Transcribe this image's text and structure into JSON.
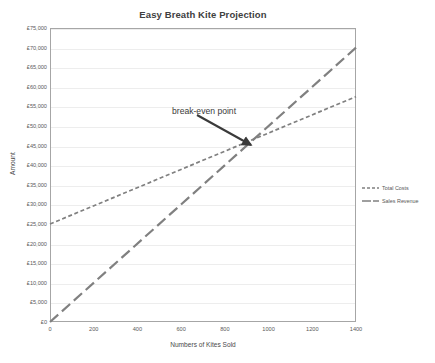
{
  "chart_data": {
    "type": "line",
    "title": "Easy Breath Kite Projection",
    "xlabel": "Numbers of Kites Sold",
    "ylabel": "Amount",
    "xlim": [
      0,
      1400
    ],
    "ylim": [
      0,
      75000
    ],
    "grid": true,
    "legend_position": "right",
    "x": [
      0,
      1400
    ],
    "xticks": [
      "0",
      "200",
      "400",
      "600",
      "800",
      "1000",
      "1200",
      "1400"
    ],
    "xtick_values": [
      0,
      200,
      400,
      600,
      800,
      1000,
      1200,
      1400
    ],
    "yticks": [
      "£0",
      "£5,000",
      "£10,000",
      "£15,000",
      "£20,000",
      "£25,000",
      "£30,000",
      "£35,000",
      "£40,000",
      "£45,000",
      "£50,000",
      "£55,000",
      "£60,000",
      "£65,000",
      "£70,000",
      "£75,000"
    ],
    "ytick_values": [
      0,
      5000,
      10000,
      15000,
      20000,
      25000,
      30000,
      35000,
      40000,
      45000,
      50000,
      55000,
      60000,
      65000,
      70000,
      75000
    ],
    "series": [
      {
        "name": "Total Costs",
        "style": "dashed",
        "color": "#808080",
        "x": [
          0,
          1400
        ],
        "values": [
          25000,
          57500
        ]
      },
      {
        "name": "Sales Revenue",
        "style": "long-dashed",
        "color": "#808080",
        "x": [
          0,
          1400
        ],
        "values": [
          0,
          70000
        ]
      }
    ],
    "annotations": [
      {
        "text": "break-even point",
        "point_x": 900,
        "point_y": 45000,
        "arrow": "down-right"
      }
    ]
  },
  "legend": {
    "items": [
      {
        "label": "Total Costs"
      },
      {
        "label": "Sales Revenue"
      }
    ]
  }
}
